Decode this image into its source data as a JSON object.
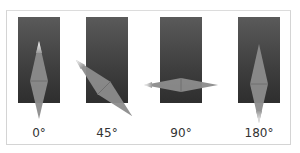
{
  "figure": {
    "panels": [
      {
        "id": "p0",
        "label": "0°",
        "angle": 0
      },
      {
        "id": "p45",
        "label": "45°",
        "angle": 45
      },
      {
        "id": "p90",
        "label": "90°",
        "angle": 90
      },
      {
        "id": "p180",
        "label": "180°",
        "angle": 180
      }
    ],
    "colors": {
      "panel_top": "#5a5a5a",
      "panel_bottom": "#2e2e2e",
      "diamond": "#8a8a8a",
      "highlight": "#f2f2f2"
    }
  }
}
